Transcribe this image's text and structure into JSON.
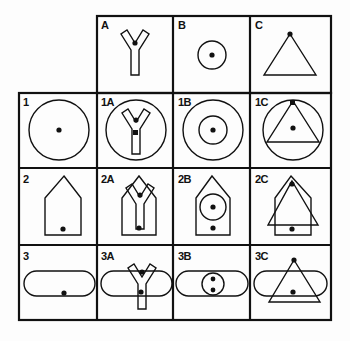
{
  "puzzle": {
    "columns": [
      {
        "id": "A",
        "label": "A",
        "shape": "y-shape"
      },
      {
        "id": "B",
        "label": "B",
        "shape": "small-circle"
      },
      {
        "id": "C",
        "label": "C",
        "shape": "triangle"
      }
    ],
    "rows": [
      {
        "id": "1",
        "label": "1",
        "shape": "large-circle"
      },
      {
        "id": "2",
        "label": "2",
        "shape": "house-pentagon"
      },
      {
        "id": "3",
        "label": "3",
        "shape": "rounded-bar"
      }
    ],
    "cells": [
      {
        "label": "1A"
      },
      {
        "label": "1B"
      },
      {
        "label": "1C"
      },
      {
        "label": "2A"
      },
      {
        "label": "2B"
      },
      {
        "label": "2C"
      },
      {
        "label": "3A"
      },
      {
        "label": "3B"
      },
      {
        "label": "3C"
      }
    ]
  },
  "colors": {
    "ink": "#111111",
    "background": "#fdfdfd"
  }
}
